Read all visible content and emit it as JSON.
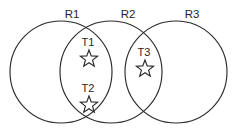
{
  "diagram": {
    "type": "venn-diagram",
    "background_color": "#ffffff",
    "stroke_color": "#2b2b2b",
    "text_color": "#1f1f1f",
    "regions": [
      {
        "id": "R1",
        "label": "R1",
        "label_x": 72,
        "label_y": 18,
        "cx": 61,
        "cy": 72,
        "r": 51
      },
      {
        "id": "R2",
        "label": "R2",
        "label_x": 128,
        "label_y": 18,
        "cx": 111,
        "cy": 72,
        "r": 51
      },
      {
        "id": "R3",
        "label": "R3",
        "label_x": 192,
        "label_y": 18,
        "cx": 176,
        "cy": 72,
        "r": 51
      }
    ],
    "targets": [
      {
        "id": "T1",
        "label": "T1",
        "label_x": 88,
        "label_y": 46,
        "star_cx": 89,
        "star_cy": 59,
        "star_r": 9,
        "in_regions": "R1,R2"
      },
      {
        "id": "T2",
        "label": "T2",
        "label_x": 88,
        "label_y": 92,
        "star_cx": 89,
        "star_cy": 105,
        "star_r": 9,
        "in_regions": "R1,R2"
      },
      {
        "id": "T3",
        "label": "T3",
        "label_x": 144,
        "label_y": 56,
        "star_cx": 145,
        "star_cy": 69,
        "star_r": 9,
        "in_regions": "R2,R3"
      }
    ]
  }
}
